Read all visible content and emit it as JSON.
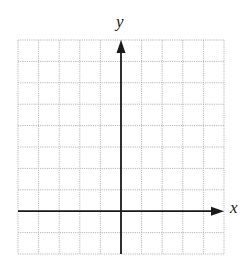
{
  "diagram": {
    "type": "coordinate-grid",
    "grid": {
      "columns": 10,
      "rows": 10,
      "left": 18,
      "top": 40,
      "width": 206,
      "height": 214,
      "line_color": "#b8b8b8",
      "line_style": "dotted"
    },
    "axes": {
      "color": "#1a1a1a",
      "y_axis_column_index": 5,
      "x_axis_row_index": 8,
      "x_label": "x",
      "y_label": "y",
      "x_arrow": "right",
      "y_arrow": "up"
    }
  }
}
